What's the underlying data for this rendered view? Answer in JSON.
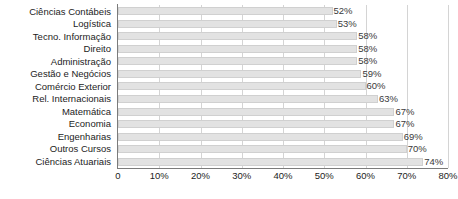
{
  "chart_data": {
    "type": "bar",
    "orientation": "horizontal",
    "title": "",
    "subtitle": "",
    "xlabel": "",
    "ylabel": "",
    "xlim": [
      0,
      80
    ],
    "grid": true,
    "legend": null,
    "legend_position": "none",
    "value_suffix": "%",
    "categories": [
      "Ciências Contábeis",
      "Logística",
      "Tecno. Informação",
      "Direito",
      "Administração",
      "Gestão e Negócios",
      "Comércio Exterior",
      "Rel. Internacionais",
      "Matemática",
      "Economia",
      "Engenharias",
      "Outros Cursos",
      "Ciências Atuariais"
    ],
    "values": [
      52,
      53,
      58,
      58,
      58,
      59,
      60,
      63,
      67,
      67,
      69,
      70,
      74
    ],
    "data_labels": [
      "52%",
      "53%",
      "58%",
      "58%",
      "58%",
      "59%",
      "60%",
      "63%",
      "67%",
      "67%",
      "69%",
      "70%",
      "74%"
    ],
    "xticks": [
      0,
      10,
      20,
      30,
      40,
      50,
      60,
      70,
      80
    ],
    "xtick_labels": [
      "0",
      "10%",
      "20%",
      "30%",
      "40%",
      "50%",
      "60%",
      "70%",
      "80%"
    ],
    "colors": {
      "bar_fill": "#e2e2e2",
      "bar_edge": "#d0d0d0",
      "gridline": "#d4d4d4",
      "axis": "#7b7b7b",
      "text": "#1c1c1c",
      "data_label_text": "#3a3a3a",
      "background": "#ffffff"
    }
  }
}
